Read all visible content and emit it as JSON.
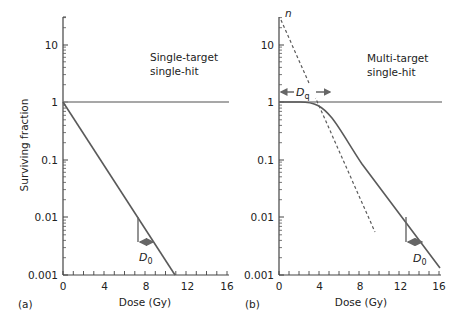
{
  "chart_data": [
    {
      "panel": "a",
      "type": "line",
      "title": "Single-target single-hit",
      "title_lines": [
        "Single-target",
        "single-hit"
      ],
      "xlabel": "Dose (Gy)",
      "ylabel": "Surviving fraction",
      "xlim": [
        0,
        16
      ],
      "ylim": [
        0.001,
        30
      ],
      "yscale": "log",
      "xticks": [
        0,
        4,
        8,
        12,
        16
      ],
      "yticks": [
        "0.001",
        "0.01",
        "0.1",
        "1",
        "10"
      ],
      "series": [
        {
          "name": "reference line SF=1",
          "x": [
            0,
            16
          ],
          "y": [
            1,
            1
          ],
          "style": "solid-thin"
        },
        {
          "name": "survival curve",
          "x": [
            0,
            11
          ],
          "y": [
            1,
            0.001
          ],
          "style": "solid"
        }
      ],
      "annotations": [
        {
          "label": "D0",
          "text": "D",
          "subscript": "0",
          "description": "Dose reducing survival to 37% (e^-1), shown with bracket near dose 7.4-8.9 Gy at SF 0.01-0.0037"
        }
      ],
      "panel_label": "(a)"
    },
    {
      "panel": "b",
      "type": "line",
      "title": "Multi-target single-hit",
      "title_lines": [
        "Multi-target",
        "single-hit"
      ],
      "xlabel": "Dose (Gy)",
      "ylabel": "Surviving fraction",
      "xlim": [
        0,
        16
      ],
      "ylim": [
        0.001,
        30
      ],
      "yscale": "log",
      "xticks": [
        0,
        4,
        8,
        12,
        16
      ],
      "yticks": [
        "0.001",
        "0.01",
        "0.1",
        "1",
        "10"
      ],
      "series": [
        {
          "name": "reference line SF=1",
          "x": [
            0,
            16
          ],
          "y": [
            1,
            1
          ],
          "style": "solid-thin"
        },
        {
          "name": "survival curve (shouldered)",
          "x": [
            0,
            2,
            3,
            4,
            5,
            6,
            8,
            10,
            12,
            14,
            16
          ],
          "y": [
            1,
            0.99,
            0.93,
            0.78,
            0.55,
            0.35,
            0.12,
            0.04,
            0.013,
            0.0045,
            0.0015
          ],
          "style": "solid"
        },
        {
          "name": "extrapolation",
          "x": [
            0,
            5
          ],
          "y": [
            22,
            1
          ],
          "style": "dashed"
        }
      ],
      "annotations": [
        {
          "label": "n",
          "text": "n",
          "description": "Extrapolation number, y-intercept of dashed line"
        },
        {
          "label": "Dq",
          "text": "D",
          "subscript": "q",
          "description": "Quasi-threshold dose, from 0 to about 5 Gy at SF=1"
        },
        {
          "label": "D0",
          "text": "D",
          "subscript": "0",
          "description": "Bracket near dose 13-14.5 Gy at SF 0.01-0.0037"
        }
      ],
      "panel_label": "(b)"
    }
  ],
  "panels": {
    "a": {
      "label": "(a)",
      "title_line1": "Single-target",
      "title_line2": "single-hit",
      "xlabel": "Dose (Gy)",
      "ylabel": "Surviving fraction",
      "d0_main": "D",
      "d0_sub": "0"
    },
    "b": {
      "label": "(b)",
      "title_line1": "Multi-target",
      "title_line2": "single-hit",
      "xlabel": "Dose (Gy)",
      "n_label": "n",
      "dq_main": "D",
      "dq_sub": "q",
      "d0_main": "D",
      "d0_sub": "0"
    }
  },
  "ticks": {
    "x": [
      "0",
      "4",
      "8",
      "12",
      "16"
    ],
    "y": [
      "10",
      "1",
      "0.1",
      "0.01",
      "0.001"
    ]
  },
  "colors": {
    "curve": "#5a5a5a",
    "reference": "#8a8a8a",
    "axis": "#444444",
    "text": "#222222"
  }
}
